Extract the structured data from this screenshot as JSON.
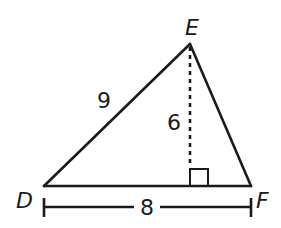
{
  "figure": {
    "type": "triangle-with-altitude",
    "vertices": {
      "D": {
        "label": "D",
        "x": 44,
        "y": 186
      },
      "E": {
        "label": "E",
        "x": 190,
        "y": 44
      },
      "F": {
        "label": "F",
        "x": 251,
        "y": 186
      }
    },
    "side_DE": {
      "label": "9"
    },
    "altitude": {
      "label": "6",
      "style": "dotted",
      "right_angle_marker": true
    },
    "base_DF": {
      "label": "8",
      "dimension_line": true
    }
  },
  "colors": {
    "stroke": "#1a1a1a",
    "background": "#ffffff"
  }
}
